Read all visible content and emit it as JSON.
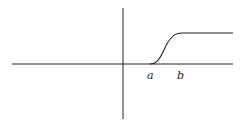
{
  "figure": {
    "type": "function-plot",
    "labels": {
      "a": "a",
      "b": "b"
    },
    "colors": {
      "stroke": "#222222",
      "background": "#ffffff"
    }
  }
}
